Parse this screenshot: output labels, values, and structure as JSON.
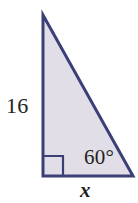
{
  "figure": {
    "kind": "right-triangle-geometry-diagram",
    "background_color": "#ffffff",
    "stroke_color": "#3a3f78",
    "fill_color": "#e2dee8",
    "text_color": "#231f20",
    "stroke_width": 3,
    "canvas": {
      "width": 138,
      "height": 203
    },
    "vertices": {
      "apex": {
        "x": 43,
        "y": 15
      },
      "bottom_left": {
        "x": 43,
        "y": 176
      },
      "bottom_right": {
        "x": 133,
        "y": 176
      }
    },
    "right_angle_marker": {
      "at_vertex": "bottom_left",
      "size": 19,
      "stroke_color": "#3a3f78"
    },
    "labels": {
      "vertical_leg": "16",
      "angle": "60°",
      "base": "x"
    }
  }
}
